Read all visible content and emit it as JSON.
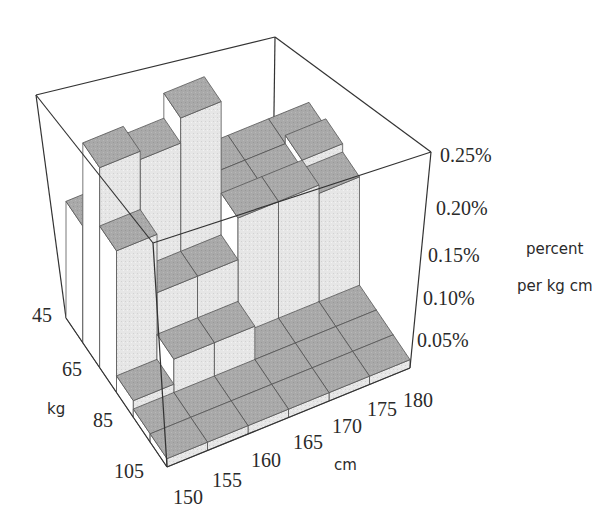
{
  "chart_data": {
    "type": "bar3d",
    "title": "",
    "x_axis": {
      "label": "cm",
      "ticks": [
        "150",
        "155",
        "160",
        "165",
        "170",
        "175",
        "180"
      ],
      "range": [
        150,
        180
      ]
    },
    "y_axis": {
      "label": "kg",
      "ticks": [
        "45",
        "65",
        "85",
        "105"
      ],
      "range": [
        45,
        105
      ]
    },
    "z_axis": {
      "label_line1": "percent",
      "label_line2": "per kg cm",
      "ticks": [
        "0.05%",
        "0.10%",
        "0.15%",
        "0.20%",
        "0.25%"
      ],
      "range": [
        0,
        0.25
      ]
    },
    "x_bins": [
      "150-155",
      "155-160",
      "160-165",
      "165-170",
      "170-175",
      "175-180"
    ],
    "y_bins": [
      "45-55",
      "55-65",
      "65-75",
      "75-85",
      "85-95",
      "95-105"
    ],
    "values_percent": [
      [
        0.14,
        0.14,
        0.14,
        0.14,
        0.14,
        0.14
      ],
      [
        0.24,
        0.23,
        0.26,
        0.14,
        0.14,
        0.15
      ],
      [
        0.17,
        0.1,
        0.1,
        0.15,
        0.15,
        0.14
      ],
      [
        0.02,
        0.05,
        0.05,
        0.01,
        0.01,
        0.01
      ],
      [
        0.01,
        0.01,
        0.01,
        0.01,
        0.01,
        0.01
      ],
      [
        0.01,
        0.01,
        0.01,
        0.01,
        0.01,
        0.01
      ]
    ],
    "grid": false,
    "legend": "none"
  }
}
